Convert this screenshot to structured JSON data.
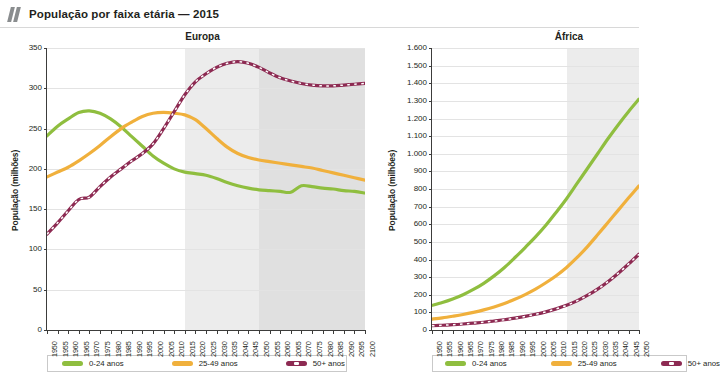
{
  "header": {
    "title": "População por faixa etária — 2015",
    "icon": "quote-bars-icon"
  },
  "legend": {
    "items": [
      {
        "label": "0-24 anos",
        "color": "#8fbe3f",
        "style": "solid"
      },
      {
        "label": "25-49 anos",
        "color": "#f0b03c",
        "style": "solid"
      },
      {
        "label": "50+ anos",
        "color": "#8d2a52",
        "style": "dashed"
      }
    ]
  },
  "chart_data": [
    {
      "type": "line",
      "title": "Europa",
      "xlabel": "",
      "ylabel": "População (milhões)",
      "ylim": [
        0,
        350
      ],
      "ytick_step": 50,
      "ytick_labels": [
        "0",
        "50",
        "100",
        "150",
        "200",
        "250",
        "300",
        "350"
      ],
      "xlim": [
        1950,
        2100
      ],
      "xtick_step": 5,
      "grid": true,
      "legend_position": "bottom",
      "shaded_bands": [
        {
          "from": 2015,
          "to": 2050,
          "color": "#ececec",
          "label": "projeção"
        },
        {
          "from": 2050,
          "to": 2100,
          "color": "#e0e0e0",
          "label": "projeção-longa"
        }
      ],
      "x": [
        1950,
        1955,
        1960,
        1965,
        1970,
        1975,
        1980,
        1985,
        1990,
        1995,
        2000,
        2005,
        2010,
        2015,
        2020,
        2025,
        2030,
        2035,
        2040,
        2045,
        2050,
        2055,
        2060,
        2065,
        2070,
        2075,
        2080,
        2085,
        2090,
        2095,
        2100
      ],
      "series": [
        {
          "name": "0-24 anos",
          "color": "#8fbe3f",
          "style": "solid",
          "values": [
            241,
            253,
            262,
            270,
            272,
            269,
            262,
            252,
            240,
            228,
            216,
            207,
            200,
            196,
            194,
            192,
            188,
            183,
            179,
            176,
            174,
            173,
            172,
            171,
            179,
            178,
            176,
            175,
            173,
            172,
            170
          ]
        },
        {
          "name": "25-49 anos",
          "color": "#f0b03c",
          "style": "solid",
          "values": [
            190,
            196,
            202,
            210,
            219,
            229,
            240,
            250,
            258,
            265,
            269,
            270,
            269,
            267,
            261,
            250,
            238,
            227,
            219,
            214,
            211,
            209,
            207,
            205,
            203,
            201,
            198,
            195,
            192,
            189,
            186
          ]
        },
        {
          "name": "50+ anos",
          "color": "#8d2a52",
          "style": "dashed",
          "values": [
            119,
            133,
            148,
            162,
            165,
            178,
            190,
            200,
            210,
            219,
            231,
            250,
            271,
            292,
            308,
            318,
            326,
            331,
            333,
            331,
            326,
            319,
            313,
            309,
            306,
            304,
            303,
            303,
            304,
            305,
            306
          ]
        }
      ]
    },
    {
      "type": "line",
      "title": "África",
      "xlabel": "",
      "ylabel": "População (milhões)",
      "ylim": [
        0,
        1600
      ],
      "ytick_step": 100,
      "ytick_labels": [
        "0",
        "100",
        "200",
        "300",
        "400",
        "500",
        "600",
        "700",
        "800",
        "900",
        "1.000",
        "1.100",
        "1.200",
        "1.300",
        "1.400",
        "1.500",
        "1.600"
      ],
      "xlim": [
        1950,
        2050
      ],
      "xtick_step": 5,
      "grid": true,
      "legend_position": "bottom",
      "cropped_right": true,
      "shaded_bands": [
        {
          "from": 2015,
          "to": 2050,
          "color": "#ececec",
          "label": "projeção"
        }
      ],
      "x": [
        1950,
        1955,
        1960,
        1965,
        1970,
        1975,
        1980,
        1985,
        1990,
        1995,
        2000,
        2005,
        2010,
        2015,
        2020,
        2025,
        2030,
        2035,
        2040,
        2045,
        2050
      ],
      "series": [
        {
          "name": "0-24 anos",
          "color": "#8fbe3f",
          "style": "solid",
          "values": [
            140,
            156,
            176,
            200,
            230,
            265,
            307,
            355,
            410,
            468,
            528,
            594,
            668,
            745,
            830,
            915,
            1000,
            1085,
            1165,
            1240,
            1310
          ]
        },
        {
          "name": "25-49 anos",
          "color": "#f0b03c",
          "style": "solid",
          "values": [
            62,
            69,
            78,
            88,
            100,
            114,
            131,
            151,
            174,
            201,
            232,
            268,
            308,
            355,
            410,
            472,
            540,
            610,
            680,
            750,
            818
          ]
        },
        {
          "name": "50+ anos",
          "color": "#8d2a52",
          "style": "dashed",
          "values": [
            24,
            27,
            30,
            34,
            39,
            44,
            51,
            58,
            67,
            77,
            89,
            103,
            120,
            140,
            165,
            196,
            232,
            274,
            322,
            375,
            430
          ]
        }
      ]
    }
  ]
}
